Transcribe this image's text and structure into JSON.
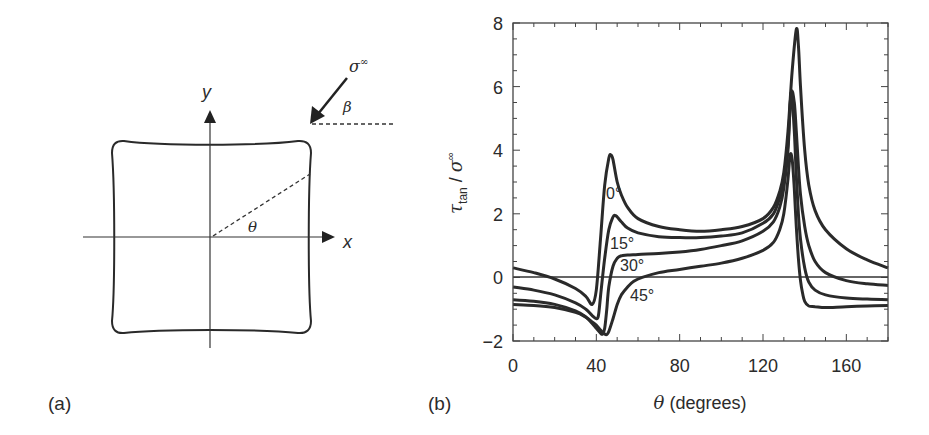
{
  "panel_a": {
    "label": "(a)",
    "axis_x_label": "x",
    "axis_y_label": "y",
    "angle_theta_label": "θ",
    "angle_beta_label": "β",
    "load_label": "σ",
    "load_superscript": "∞",
    "shape": "rounded square with slightly concave edges"
  },
  "panel_b": {
    "label": "(b)",
    "curve_labels": [
      "0°",
      "15°",
      "30°",
      "45°"
    ]
  },
  "chart_data": {
    "type": "line",
    "title": "",
    "xlabel": "θ (degrees)",
    "ylabel": "τ_tan / σ^∞",
    "xlim": [
      0,
      180
    ],
    "ylim": [
      -2,
      8
    ],
    "x_ticks": [
      0,
      40,
      80,
      120,
      160
    ],
    "y_ticks": [
      -2,
      0,
      2,
      4,
      6,
      8
    ],
    "x_minor_step": 10,
    "y_minor_step": 0.5,
    "grid": false,
    "legend": "inline labels next to curves",
    "reference_line": {
      "y": 0
    },
    "series": [
      {
        "name": "0°",
        "x": [
          0,
          10,
          20,
          30,
          35,
          38,
          40,
          42,
          44,
          46,
          47,
          48,
          50,
          52,
          55,
          60,
          70,
          80,
          90,
          100,
          110,
          120,
          125,
          128,
          130,
          132,
          134,
          136,
          137,
          138,
          140,
          142,
          145,
          150,
          160,
          170,
          180
        ],
        "y": [
          0.3,
          0.15,
          -0.05,
          -0.35,
          -0.6,
          -0.85,
          -0.4,
          1.2,
          2.9,
          3.75,
          3.85,
          3.7,
          3.0,
          2.6,
          2.2,
          1.85,
          1.6,
          1.5,
          1.45,
          1.5,
          1.6,
          1.85,
          2.2,
          2.7,
          3.3,
          4.6,
          6.5,
          7.8,
          7.3,
          6.0,
          4.0,
          2.9,
          2.1,
          1.5,
          0.9,
          0.55,
          0.3
        ]
      },
      {
        "name": "15°",
        "x": [
          0,
          10,
          20,
          30,
          35,
          38,
          40,
          41,
          42,
          44,
          46,
          48,
          49,
          50,
          52,
          55,
          60,
          70,
          80,
          90,
          100,
          110,
          120,
          125,
          128,
          130,
          132,
          133.5,
          135,
          136,
          137,
          138,
          140,
          142,
          145,
          150,
          160,
          170,
          180
        ],
        "y": [
          -0.3,
          -0.4,
          -0.55,
          -0.8,
          -1.0,
          -1.2,
          -1.3,
          -1.2,
          -0.6,
          0.6,
          1.5,
          1.9,
          1.95,
          1.9,
          1.75,
          1.55,
          1.4,
          1.28,
          1.25,
          1.25,
          1.3,
          1.4,
          1.7,
          2.0,
          2.5,
          3.0,
          4.2,
          5.8,
          5.5,
          4.6,
          3.5,
          2.6,
          1.6,
          1.0,
          0.5,
          0.15,
          -0.1,
          -0.2,
          -0.25
        ]
      },
      {
        "name": "30°",
        "x": [
          0,
          10,
          20,
          30,
          35,
          38,
          40,
          42,
          43,
          44,
          45,
          46,
          48,
          50,
          52,
          55,
          60,
          70,
          80,
          90,
          100,
          110,
          120,
          125,
          128,
          130,
          132,
          133.5,
          135,
          136,
          137,
          138,
          140,
          142,
          145,
          150,
          160,
          170,
          180
        ],
        "y": [
          -0.7,
          -0.75,
          -0.85,
          -1.05,
          -1.25,
          -1.45,
          -1.6,
          -1.75,
          -1.78,
          -1.6,
          -1.0,
          -0.3,
          0.35,
          0.6,
          0.68,
          0.7,
          0.72,
          0.75,
          0.8,
          0.88,
          1.0,
          1.15,
          1.45,
          1.75,
          2.2,
          2.8,
          4.0,
          5.8,
          4.6,
          3.2,
          2.0,
          1.2,
          0.3,
          -0.15,
          -0.4,
          -0.55,
          -0.65,
          -0.68,
          -0.7
        ]
      },
      {
        "name": "45°",
        "x": [
          0,
          10,
          20,
          30,
          35,
          38,
          40,
          42,
          44,
          45,
          46,
          48,
          50,
          52,
          55,
          58,
          62,
          70,
          80,
          90,
          100,
          110,
          120,
          125,
          128,
          130,
          132,
          133,
          134,
          135,
          136,
          137,
          138,
          139,
          140,
          142,
          145,
          150,
          160,
          170,
          180
        ],
        "y": [
          -0.85,
          -0.88,
          -0.95,
          -1.1,
          -1.25,
          -1.4,
          -1.5,
          -1.65,
          -1.78,
          -1.8,
          -1.7,
          -1.3,
          -0.85,
          -0.55,
          -0.3,
          -0.12,
          0.0,
          0.15,
          0.25,
          0.35,
          0.45,
          0.6,
          0.85,
          1.1,
          1.5,
          2.0,
          3.1,
          3.85,
          3.7,
          2.8,
          1.6,
          0.6,
          -0.1,
          -0.5,
          -0.75,
          -0.9,
          -0.92,
          -0.95,
          -0.92,
          -0.9,
          -0.88
        ]
      }
    ]
  }
}
